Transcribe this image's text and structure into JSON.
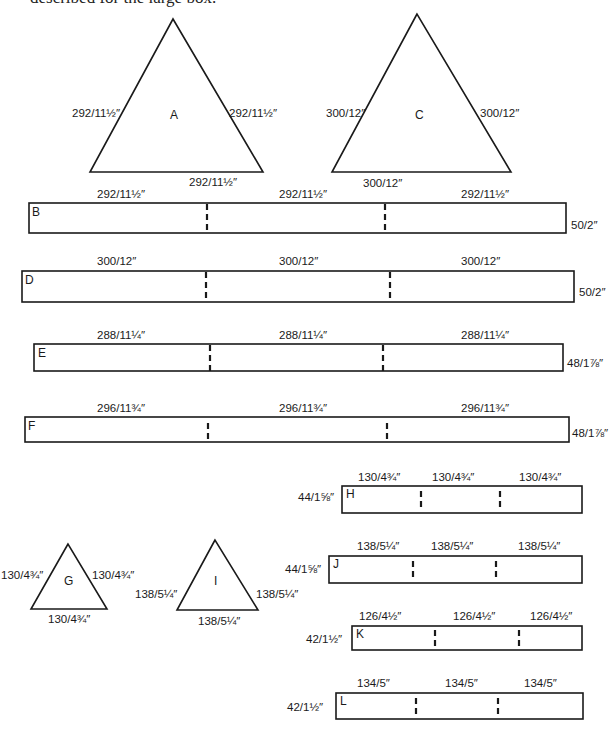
{
  "intro_text": "described for the large box.",
  "triangles": {
    "A": {
      "letter": "A",
      "left": "292/11½″",
      "right": "292/11½″",
      "base": "292/11½″"
    },
    "C": {
      "letter": "C",
      "left": "300/12″",
      "right": "300/12″",
      "base": "300/12″"
    },
    "G": {
      "letter": "G",
      "left": "130/4¾″",
      "right": "130/4¾″",
      "base": "130/4¾″"
    },
    "I": {
      "letter": "I",
      "left": "138/5¼″",
      "right": "138/5¼″",
      "base": "138/5¼″"
    }
  },
  "strips": {
    "B": {
      "letter": "B",
      "segments": [
        "292/11½″",
        "292/11½″",
        "292/11½″"
      ],
      "height": "50/2″"
    },
    "D": {
      "letter": "D",
      "segments": [
        "300/12″",
        "300/12″",
        "300/12″"
      ],
      "height": "50/2″"
    },
    "E": {
      "letter": "E",
      "segments": [
        "288/11¼″",
        "288/11¼″",
        "288/11¼″"
      ],
      "height": "48/1⅞″"
    },
    "F": {
      "letter": "F",
      "segments": [
        "296/11¾″",
        "296/11¾″",
        "296/11¾″"
      ],
      "height": "48/1⅞″"
    },
    "H": {
      "letter": "H",
      "segments": [
        "130/4¾″",
        "130/4¾″",
        "130/4¾″"
      ],
      "height": "44/1⅝″"
    },
    "J": {
      "letter": "J",
      "segments": [
        "138/5¼″",
        "138/5¼″",
        "138/5¼″"
      ],
      "height": "44/1⅝″"
    },
    "K": {
      "letter": "K",
      "segments": [
        "126/4½″",
        "126/4½″",
        "126/4½″"
      ],
      "height": "42/1½″"
    },
    "L": {
      "letter": "L",
      "segments": [
        "134/5″",
        "134/5″",
        "134/5″"
      ],
      "height": "42/1½″"
    }
  },
  "colors": {
    "line": "#1a1a1a",
    "background": "#ffffff"
  }
}
